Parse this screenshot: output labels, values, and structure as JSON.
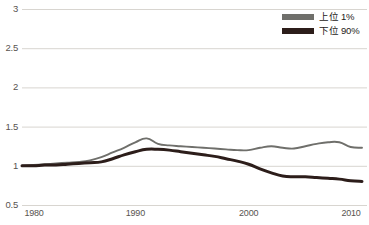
{
  "chart_data": {
    "type": "line",
    "title": "",
    "subtitle": "",
    "xlabel": "",
    "ylabel": "",
    "xlim": [
      1980,
      2010
    ],
    "ylim": [
      0.5,
      3
    ],
    "grid": true,
    "grid_axis": "y",
    "legend_position": "top-right",
    "y_ticks": [
      "0.5",
      "1",
      "1.5",
      "2",
      "2.5",
      "3"
    ],
    "y_tick_values": [
      0.5,
      1,
      1.5,
      2,
      2.5,
      3
    ],
    "x_ticks": [
      "1980",
      "1990",
      "2000",
      "2010"
    ],
    "x_tick_values": [
      1980,
      1990,
      2000,
      2010
    ],
    "x": [
      1980,
      1981,
      1982,
      1983,
      1984,
      1985,
      1986,
      1987,
      1988,
      1989,
      1990,
      1991,
      1992,
      1993,
      1994,
      1995,
      1996,
      1997,
      1998,
      1999,
      2000,
      2001,
      2002,
      2003,
      2004,
      2005,
      2006,
      2007,
      2008,
      2009,
      2010
    ],
    "series": [
      {
        "name": "上位 1%",
        "color": "#6f6f6b",
        "values": [
          1.0,
          1.01,
          1.02,
          1.03,
          1.04,
          1.05,
          1.07,
          1.11,
          1.17,
          1.23,
          1.3,
          1.35,
          1.28,
          1.26,
          1.25,
          1.24,
          1.23,
          1.22,
          1.21,
          1.2,
          1.2,
          1.23,
          1.25,
          1.23,
          1.22,
          1.25,
          1.28,
          1.3,
          1.3,
          1.24,
          1.23
        ]
      },
      {
        "name": "下位 90%",
        "color": "#2c1d1a",
        "values": [
          1.0,
          1.0,
          1.01,
          1.01,
          1.02,
          1.03,
          1.04,
          1.05,
          1.09,
          1.14,
          1.18,
          1.21,
          1.21,
          1.2,
          1.18,
          1.16,
          1.14,
          1.12,
          1.09,
          1.06,
          1.02,
          0.96,
          0.91,
          0.87,
          0.86,
          0.86,
          0.85,
          0.84,
          0.83,
          0.81,
          0.8
        ]
      }
    ]
  },
  "legend": {
    "items": [
      {
        "label": "上位 1%",
        "color": "#6f6f6b"
      },
      {
        "label": "下位 90%",
        "color": "#2c1d1a"
      }
    ]
  },
  "axes": {
    "y_labels": [
      "3",
      "2.5",
      "2",
      "1.5",
      "1",
      "0.5"
    ],
    "x_labels": [
      "1980",
      "1990",
      "2000",
      "2010"
    ]
  },
  "colors": {
    "grid": "#d8d5d0",
    "tick_text": "#58534f",
    "legend_text": "#1d1a18",
    "background": "#ffffff",
    "series_top1": "#6f6f6b",
    "series_bottom90": "#2c1d1a"
  }
}
